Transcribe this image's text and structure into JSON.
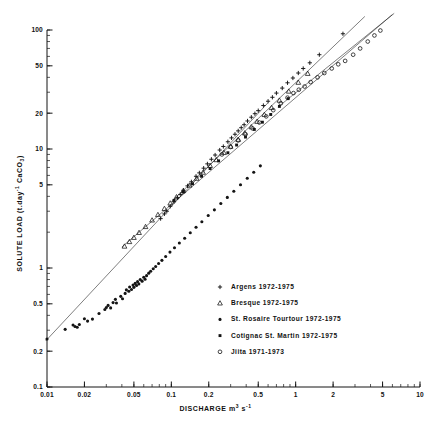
{
  "chart_data": {
    "type": "scatter",
    "title": "",
    "xlabel": "DISCHARGE  m3 s-1",
    "xlabel_main": "DISCHARGE",
    "xlabel_unit_base": "m",
    "xlabel_unit_exp1": "3",
    "xlabel_unit_base2": "s",
    "xlabel_unit_exp2": "-1",
    "ylabel": "SOLUTE LOAD (t.day-1 CaCO3)",
    "ylabel_part1": "SOLUTE LOAD (t.day",
    "ylabel_exp": "-1",
    "ylabel_part2": " CaCO",
    "ylabel_sub": "3",
    "ylabel_part3": ")",
    "xscale": "log",
    "yscale": "log",
    "xlim": [
      0.01,
      10
    ],
    "ylim": [
      0.1,
      100
    ],
    "grid": false,
    "legend_position": "center-right-inside",
    "xticks": [
      0.01,
      0.02,
      0.05,
      0.1,
      0.2,
      0.5,
      1,
      2,
      5,
      10
    ],
    "xtick_labels": [
      "0.01",
      "0.02",
      "0.05",
      "0.1",
      "0.2",
      "0.5",
      "1",
      "2",
      "5",
      "10"
    ],
    "yticks": [
      0.1,
      0.2,
      0.5,
      1,
      5,
      10,
      20,
      50,
      100
    ],
    "ytick_labels": [
      "0.1",
      "0.2",
      "0.5",
      "1",
      "5",
      "10",
      "20",
      "50",
      "100"
    ],
    "series": [
      {
        "name": "Argens 1972-1975",
        "marker": "plus",
        "color": "#141414",
        "trendline": {
          "x": [
            0.1,
            3.6
          ],
          "y": [
            3.6,
            130.0
          ]
        },
        "points": [
          [
            0.082,
            2.6
          ],
          [
            0.088,
            2.85
          ],
          [
            0.092,
            3.0
          ],
          [
            0.098,
            3.3
          ],
          [
            0.105,
            3.6
          ],
          [
            0.112,
            3.9
          ],
          [
            0.118,
            4.15
          ],
          [
            0.125,
            4.5
          ],
          [
            0.135,
            4.9
          ],
          [
            0.145,
            5.3
          ],
          [
            0.158,
            5.9
          ],
          [
            0.168,
            6.3
          ],
          [
            0.182,
            6.9
          ],
          [
            0.195,
            7.5
          ],
          [
            0.21,
            8.2
          ],
          [
            0.225,
            8.9
          ],
          [
            0.245,
            9.8
          ],
          [
            0.262,
            10.5
          ],
          [
            0.285,
            11.5
          ],
          [
            0.305,
            12.4
          ],
          [
            0.325,
            13.3
          ],
          [
            0.345,
            14.2
          ],
          [
            0.365,
            15.1
          ],
          [
            0.385,
            16.0
          ],
          [
            0.41,
            17.2
          ],
          [
            0.44,
            18.5
          ],
          [
            0.47,
            19.8
          ],
          [
            0.5,
            21.0
          ],
          [
            0.55,
            23.2
          ],
          [
            0.6,
            25.2
          ],
          [
            0.65,
            27.2
          ],
          [
            0.7,
            29.5
          ],
          [
            0.78,
            32.5
          ],
          [
            0.86,
            36.0
          ],
          [
            0.95,
            39.5
          ],
          [
            1.05,
            43.5
          ],
          [
            1.15,
            47.5
          ],
          [
            1.3,
            53.0
          ],
          [
            1.55,
            62.0
          ],
          [
            2.4,
            93.0
          ],
          [
            3.1,
            118.0
          ]
        ]
      },
      {
        "name": "Bresque 1972-1975",
        "marker": "triangle",
        "color": "#141414",
        "trendline": {
          "x": [
            0.04,
            6.0
          ],
          "y": [
            1.5,
            135.0
          ]
        },
        "points": [
          [
            0.042,
            1.52
          ],
          [
            0.046,
            1.66
          ],
          [
            0.05,
            1.8
          ],
          [
            0.055,
            1.98
          ],
          [
            0.062,
            2.22
          ],
          [
            0.07,
            2.52
          ],
          [
            0.078,
            2.8
          ],
          [
            0.088,
            3.15
          ],
          [
            0.098,
            3.5
          ],
          [
            0.11,
            3.95
          ],
          [
            0.125,
            4.45
          ],
          [
            0.14,
            4.95
          ],
          [
            0.16,
            5.65
          ],
          [
            0.18,
            6.35
          ],
          [
            0.205,
            7.25
          ],
          [
            0.23,
            8.1
          ],
          [
            0.265,
            9.3
          ],
          [
            0.3,
            10.5
          ],
          [
            0.345,
            12.0
          ],
          [
            0.39,
            13.6
          ],
          [
            0.44,
            15.3
          ],
          [
            0.49,
            17.0
          ],
          [
            0.56,
            19.4
          ],
          [
            0.64,
            22.2
          ],
          [
            0.74,
            25.6
          ],
          [
            0.88,
            30.5
          ],
          [
            1.05,
            36.2
          ],
          [
            1.25,
            43.0
          ],
          [
            3.8,
            118.0
          ],
          [
            4.6,
            128.0
          ],
          [
            5.2,
            134.0
          ]
        ]
      },
      {
        "name": "St. Rosaire Tourtour 1972-1975",
        "marker": "dot",
        "color": "#141414",
        "trendline": {
          "x": [
            0.0098,
            0.6
          ],
          "y": [
            0.245,
            24.5
          ]
        },
        "points": [
          [
            0.01,
            0.253
          ],
          [
            0.014,
            0.305
          ],
          [
            0.0162,
            0.332
          ],
          [
            0.0168,
            0.322
          ],
          [
            0.0175,
            0.318
          ],
          [
            0.0182,
            0.335
          ],
          [
            0.02,
            0.375
          ],
          [
            0.0212,
            0.358
          ],
          [
            0.0232,
            0.372
          ],
          [
            0.0262,
            0.415
          ],
          [
            0.0292,
            0.448
          ],
          [
            0.03,
            0.465
          ],
          [
            0.031,
            0.485
          ],
          [
            0.0325,
            0.462
          ],
          [
            0.034,
            0.512
          ],
          [
            0.0355,
            0.545
          ],
          [
            0.0362,
            0.508
          ],
          [
            0.0392,
            0.578
          ],
          [
            0.0405,
            0.552
          ],
          [
            0.0425,
            0.612
          ],
          [
            0.0435,
            0.655
          ],
          [
            0.0455,
            0.638
          ],
          [
            0.0462,
            0.692
          ],
          [
            0.0478,
            0.66
          ],
          [
            0.0492,
            0.718
          ],
          [
            0.05,
            0.688
          ],
          [
            0.0512,
            0.742
          ],
          [
            0.0525,
            0.712
          ],
          [
            0.0535,
            0.768
          ],
          [
            0.0548,
            0.735
          ],
          [
            0.0562,
            0.8
          ],
          [
            0.0582,
            0.775
          ],
          [
            0.06,
            0.835
          ],
          [
            0.0615,
            0.805
          ],
          [
            0.0632,
            0.862
          ],
          [
            0.0658,
            0.905
          ],
          [
            0.0682,
            0.94
          ],
          [
            0.0715,
            0.985
          ],
          [
            0.0748,
            1.03
          ],
          [
            0.079,
            1.09
          ],
          [
            0.084,
            1.16
          ],
          [
            0.09,
            1.25
          ],
          [
            0.0975,
            1.36
          ],
          [
            0.106,
            1.48
          ],
          [
            0.116,
            1.62
          ],
          [
            0.128,
            1.78
          ],
          [
            0.142,
            1.98
          ],
          [
            0.158,
            2.2
          ],
          [
            0.176,
            2.45
          ],
          [
            0.198,
            2.76
          ],
          [
            0.222,
            3.08
          ],
          [
            0.25,
            3.48
          ],
          [
            0.282,
            3.92
          ],
          [
            0.318,
            4.42
          ],
          [
            0.36,
            5.0
          ],
          [
            0.408,
            5.68
          ],
          [
            0.46,
            6.38
          ],
          [
            0.52,
            7.22
          ]
        ]
      },
      {
        "name": "Cotignac St. Martin 1972-1975",
        "marker": "square",
        "color": "#141414",
        "trendline": null,
        "points": [
          [
            0.105,
            3.7
          ],
          [
            0.125,
            4.35
          ],
          [
            0.148,
            5.1
          ],
          [
            0.175,
            5.9
          ],
          [
            0.205,
            6.85
          ],
          [
            0.24,
            7.95
          ],
          [
            0.285,
            9.3
          ],
          [
            0.335,
            10.8
          ],
          [
            0.395,
            12.6
          ],
          [
            0.465,
            14.6
          ],
          [
            0.54,
            16.8
          ],
          [
            0.63,
            19.5
          ],
          [
            0.74,
            22.8
          ],
          [
            0.87,
            26.5
          ]
        ]
      },
      {
        "name": "Jiita 1971-1973",
        "marker": "circle",
        "color": "#141414",
        "trendline": {
          "x": [
            0.72,
            6.2
          ],
          "y": [
            22.5,
            138.0
          ]
        },
        "points": [
          [
            0.255,
            9.0
          ],
          [
            0.3,
            10.4
          ],
          [
            0.345,
            11.8
          ],
          [
            0.395,
            13.3
          ],
          [
            0.45,
            14.9
          ],
          [
            0.51,
            16.7
          ],
          [
            0.58,
            18.8
          ],
          [
            0.66,
            21.2
          ],
          [
            0.76,
            24.2
          ],
          [
            0.86,
            27.0
          ],
          [
            0.96,
            29.5
          ],
          [
            1.06,
            31.5
          ],
          [
            1.18,
            33.5
          ],
          [
            1.32,
            36.5
          ],
          [
            1.5,
            40.0
          ],
          [
            1.7,
            43.5
          ],
          [
            1.95,
            47.5
          ],
          [
            2.2,
            51.5
          ],
          [
            2.5,
            55.0
          ],
          [
            2.9,
            62.0
          ],
          [
            3.3,
            70.0
          ],
          [
            3.8,
            80.0
          ],
          [
            4.3,
            90.0
          ],
          [
            4.8,
            99.0
          ],
          [
            5.6,
            120.0
          ],
          [
            6.0,
            133.0
          ]
        ]
      }
    ]
  },
  "legend": {
    "entries": [
      {
        "marker": "plus",
        "label": "Argens 1972-1975"
      },
      {
        "marker": "triangle",
        "label": "Bresque 1972-1975"
      },
      {
        "marker": "dot",
        "label": "St. Rosaire Tourtour 1972-1975"
      },
      {
        "marker": "square",
        "label": "Cotignac St. Martin 1972-1975"
      },
      {
        "marker": "circle",
        "label": "Jiita 1971-1973"
      }
    ]
  },
  "colors": {
    "ink": "#141414",
    "background": "#ffffff",
    "axis": "#2a2a2a"
  }
}
